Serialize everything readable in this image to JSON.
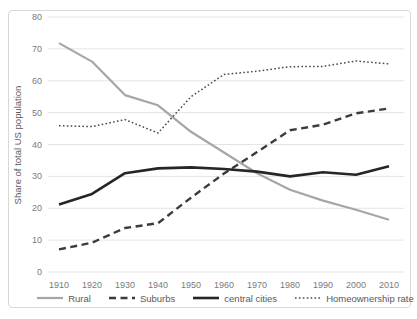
{
  "chart_data": {
    "type": "line",
    "title": "",
    "xlabel": "",
    "ylabel": "Share of total US population",
    "ylim": [
      0,
      80
    ],
    "ytick_step": 10,
    "grid": "horizontal-only",
    "legend_position": "bottom",
    "categories": [
      "1910",
      "1920",
      "1930",
      "1940",
      "1950",
      "1960",
      "1970",
      "1980",
      "1990",
      "2000",
      "2010"
    ],
    "series": [
      {
        "name": "Rural",
        "values": [
          71.8,
          66.0,
          55.5,
          52.3,
          44.0,
          37.5,
          31.0,
          25.8,
          22.4,
          19.5,
          16.4
        ],
        "color": "#a6a6a6",
        "style": "solid",
        "width": 2.2
      },
      {
        "name": "Suburbs",
        "values": [
          7.1,
          9.2,
          13.8,
          15.3,
          23.3,
          30.9,
          37.6,
          44.5,
          46.2,
          49.8,
          51.3
        ],
        "color": "#3b3b3b",
        "style": "dashed",
        "width": 2.4
      },
      {
        "name": "central cities",
        "values": [
          21.2,
          24.5,
          31.0,
          32.5,
          32.8,
          32.3,
          31.5,
          30.0,
          31.3,
          30.5,
          33.2
        ],
        "color": "#262626",
        "style": "solid",
        "width": 2.6
      },
      {
        "name": "Homeownership rate",
        "values": [
          45.9,
          45.6,
          47.8,
          43.6,
          55.0,
          62.0,
          63.0,
          64.4,
          64.5,
          66.2,
          65.3
        ],
        "color": "#4a4a4a",
        "style": "dotted",
        "width": 1.5
      }
    ]
  },
  "axis_style": {
    "tick_label_color": "#7a7a7a",
    "axis_title_color": "#595959",
    "gridline_color": "#e4e4e4",
    "frame_border_color": "#d8d8d8"
  }
}
